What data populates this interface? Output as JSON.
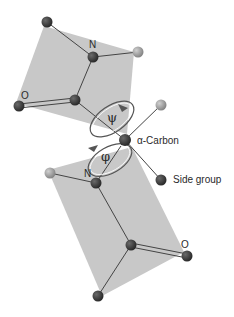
{
  "diagram": {
    "labels": {
      "n_top": "N",
      "o_top": "O",
      "psi": "ψ",
      "phi": "φ",
      "alpha_carbon": "α-Carbon",
      "side_group": "Side group",
      "n_bottom": "N",
      "o_bottom": "O"
    },
    "colors": {
      "plane": "#c6c6c6",
      "atom_dark": "#3a3a3a",
      "atom_light": "#9a9a9a",
      "bond": "#444444",
      "text": "#2a2a2a"
    },
    "planes": [
      {
        "name": "upper-peptide-plane",
        "points": "44,26 134,52 127,134 16,103"
      },
      {
        "name": "lower-peptide-plane",
        "points": "48,170 132,147 184,252 102,296"
      }
    ],
    "atoms": [
      {
        "name": "upper-corner-atom",
        "x": 47,
        "y": 22,
        "type": "dark"
      },
      {
        "name": "upper-n-atom",
        "x": 93,
        "y": 57,
        "type": "dark"
      },
      {
        "name": "upper-h-atom",
        "x": 138,
        "y": 52,
        "type": "light"
      },
      {
        "name": "upper-o-atom",
        "x": 19,
        "y": 106,
        "type": "dark"
      },
      {
        "name": "upper-c-atom",
        "x": 75,
        "y": 100,
        "type": "dark"
      },
      {
        "name": "alpha-carbon-atom",
        "x": 125,
        "y": 140,
        "type": "dark"
      },
      {
        "name": "alpha-h-atom",
        "x": 161,
        "y": 105,
        "type": "light"
      },
      {
        "name": "side-group-atom",
        "x": 161,
        "y": 180,
        "type": "dark"
      },
      {
        "name": "lower-h-atom",
        "x": 50,
        "y": 173,
        "type": "light"
      },
      {
        "name": "lower-n-atom",
        "x": 96,
        "y": 183,
        "type": "dark"
      },
      {
        "name": "lower-c-atom",
        "x": 131,
        "y": 245,
        "type": "dark"
      },
      {
        "name": "lower-o-atom",
        "x": 187,
        "y": 256,
        "type": "dark"
      },
      {
        "name": "lower-corner-atom",
        "x": 98,
        "y": 296,
        "type": "dark"
      }
    ]
  }
}
